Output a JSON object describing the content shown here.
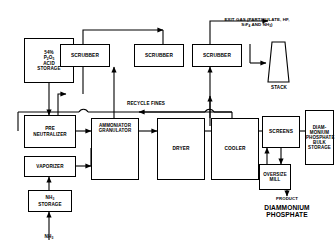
{
  "diagram": {
    "type": "process-flow",
    "ink_color": "#000000",
    "background": "#ffffff"
  },
  "boxes": {
    "acid_storage": {
      "label": "54%\nP2O5\nACID\nSTORAGE",
      "lines": [
        "54%",
        "P2O5",
        "ACID",
        "STORAGE"
      ]
    },
    "pre_neutralizer": {
      "lines": [
        "PRE",
        "NEUTRALIZER"
      ]
    },
    "vaporizer": {
      "lines": [
        "VAPORIZER"
      ]
    },
    "nh3_storage": {
      "lines": [
        "NH3",
        "STORAGE"
      ]
    },
    "scrubber_1": {
      "lines": [
        "SCRUBBER"
      ]
    },
    "scrubber_2": {
      "lines": [
        "SCRUBBER"
      ]
    },
    "scrubber_3": {
      "lines": [
        "SCRUBBER"
      ]
    },
    "ammoniator": {
      "lines": [
        "AMMONIATOR",
        "GRANULATOR"
      ]
    },
    "dryer": {
      "lines": [
        "DRYER"
      ]
    },
    "cooler": {
      "lines": [
        "COOLER"
      ]
    },
    "screens": {
      "lines": [
        "SCREENS"
      ]
    },
    "oversize_mill": {
      "lines": [
        "OVERSIZE",
        "MILL"
      ]
    },
    "bulk_storage": {
      "lines": [
        "DIAM-",
        "MONIUM",
        "PHOSPHATE",
        "BULK",
        "STORAGE"
      ]
    }
  },
  "labels": {
    "exit_gas": {
      "line1": "EXIT GAS (PARTICULATE, HF,",
      "line2_pre": "SiF",
      "line2_sub": "4",
      "line2_post": " AND NH",
      "line2_sub2": "3",
      "line2_end": ")"
    },
    "stack": "STACK",
    "recycle_fines": "RECYCLE FINES",
    "nh3_feed_pre": "NH",
    "nh3_feed_sub": "3",
    "product_caption": "PRODUCT",
    "product_name_line1": "DIAMMONIUM",
    "product_name_line2": "PHOSPHATE"
  }
}
